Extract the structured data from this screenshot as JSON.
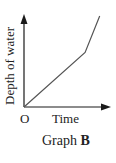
{
  "chart_data": {
    "type": "line",
    "title": "Graph B",
    "caption_prefix": "Graph",
    "caption_letter": "B",
    "xlabel": "Time",
    "ylabel": "Depth of water",
    "origin_label": "O",
    "grid": false,
    "axis_ticks": false,
    "series": [
      {
        "name": "Depth of water",
        "description": "Piecewise linear: increases steadily from origin, then bends upward to a steeper slope",
        "points_relative": [
          [
            0,
            0
          ],
          [
            0.71,
            0.6
          ],
          [
            0.88,
            1.0
          ]
        ]
      }
    ],
    "colors": {
      "axis": "#1a1a1a",
      "line": "#555555",
      "text": "#222222"
    }
  }
}
